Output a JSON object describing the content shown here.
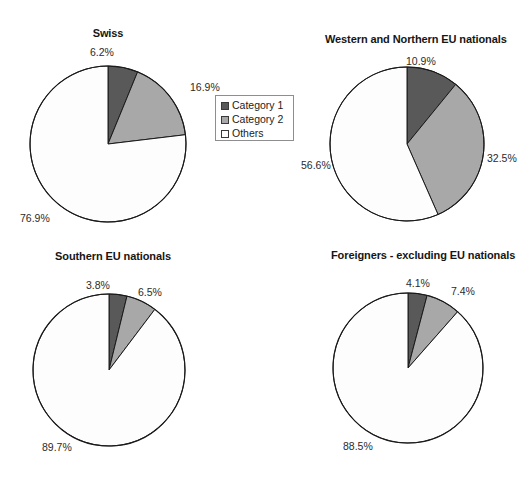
{
  "figure": {
    "background_color": "#ffffff",
    "width": 532,
    "height": 480
  },
  "legend": {
    "name": "chart-legend",
    "items": [
      {
        "label": "Category 1",
        "color": "#595959"
      },
      {
        "label": "Category 2",
        "color": "#a8a8a8"
      },
      {
        "label": "Others",
        "color": "#ffffff"
      }
    ]
  },
  "colors": {
    "category_1": "#595959",
    "category_2": "#a8a8a8",
    "others": "#fdfdfd",
    "outline": "#1a1a1a",
    "text": "#2b2b2b"
  },
  "chart_data": [
    {
      "type": "pie",
      "title": "Swiss",
      "categories": [
        "Category 1",
        "Category 2",
        "Others"
      ],
      "values": [
        6.2,
        16.9,
        76.9
      ],
      "labels": [
        "6.2%",
        "16.9%",
        "76.9%"
      ],
      "colors": [
        "#595959",
        "#a8a8a8",
        "#fdfdfd"
      ],
      "start_angle": 0,
      "direction": "clockwise",
      "center": [
        108,
        144
      ],
      "radius": 79
    },
    {
      "type": "pie",
      "title": "Western and Northern EU nationals",
      "categories": [
        "Category 1",
        "Category 2",
        "Others"
      ],
      "values": [
        10.9,
        32.5,
        56.6
      ],
      "labels": [
        "10.9%",
        "32.5%",
        "56.6%"
      ],
      "colors": [
        "#595959",
        "#a8a8a8",
        "#fdfdfd"
      ],
      "start_angle": 0,
      "direction": "clockwise",
      "center": [
        407,
        144
      ],
      "radius": 78
    },
    {
      "type": "pie",
      "title": "Southern EU nationals",
      "categories": [
        "Category 1",
        "Category 2",
        "Others"
      ],
      "values": [
        3.8,
        6.5,
        89.7
      ],
      "labels": [
        "3.8%",
        "6.5%",
        "89.7%"
      ],
      "colors": [
        "#595959",
        "#a8a8a8",
        "#fdfdfd"
      ],
      "start_angle": 0,
      "direction": "clockwise",
      "center": [
        109,
        370
      ],
      "radius": 77
    },
    {
      "type": "pie",
      "title": "Foreigners - excluding EU nationals",
      "categories": [
        "Category 1",
        "Category 2",
        "Others"
      ],
      "values": [
        4.1,
        7.4,
        88.5
      ],
      "labels": [
        "4.1%",
        "7.4%",
        "88.5%"
      ],
      "colors": [
        "#595959",
        "#a8a8a8",
        "#fdfdfd"
      ],
      "start_angle": 0,
      "direction": "clockwise",
      "center": [
        408,
        368
      ],
      "radius": 76
    }
  ],
  "label_positions": {
    "swiss": [
      {
        "text": "6.2%",
        "left": 90,
        "top": 46
      },
      {
        "text": "16.9%",
        "left": 190,
        "top": 81
      },
      {
        "text": "76.9%",
        "left": 20,
        "top": 212
      }
    ],
    "western_northern": [
      {
        "text": "10.9%",
        "left": 406,
        "top": 55
      },
      {
        "text": "32.5%",
        "left": 487,
        "top": 152
      },
      {
        "text": "56.6%",
        "left": 301,
        "top": 159
      }
    ],
    "southern": [
      {
        "text": "3.8%",
        "left": 86,
        "top": 279
      },
      {
        "text": "6.5%",
        "left": 138,
        "top": 286
      },
      {
        "text": "89.7%",
        "left": 42,
        "top": 441
      }
    ],
    "foreigners": [
      {
        "text": "4.1%",
        "left": 406,
        "top": 277
      },
      {
        "text": "7.4%",
        "left": 451,
        "top": 285
      },
      {
        "text": "88.5%",
        "left": 343,
        "top": 440
      }
    ]
  },
  "title_positions": {
    "swiss": {
      "text": "Swiss",
      "left": 58,
      "top": 27,
      "width": 100
    },
    "western_northern": {
      "text": "Western and Northern EU nationals",
      "left": 325,
      "top": 33,
      "width": 176
    },
    "southern": {
      "text": "Southern EU nationals",
      "left": 52,
      "top": 250,
      "width": 122
    },
    "foreigners": {
      "text": "Foreigners - excluding EU nationals",
      "left": 331,
      "top": 249,
      "width": 180
    }
  }
}
